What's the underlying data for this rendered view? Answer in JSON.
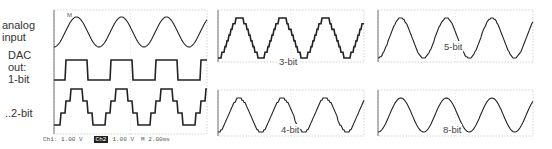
{
  "labels": {
    "analog": "analog\ninput",
    "analog_l1": "analog",
    "analog_l2": "input",
    "dac_l1": "DAC",
    "dac_l2": "out:",
    "dac_l3": "1-bit",
    "bit2": "..2-bit"
  },
  "panels": [
    {
      "id": "left",
      "x": 54,
      "y": 10,
      "w": 153,
      "h": 124,
      "label": ""
    },
    {
      "id": "3bit",
      "x": 218,
      "y": 10,
      "w": 146,
      "h": 52,
      "label": "3-bit",
      "bits": 3
    },
    {
      "id": "5bit",
      "x": 378,
      "y": 10,
      "w": 155,
      "h": 52,
      "label": "5-bit",
      "bits": 5
    },
    {
      "id": "4bit",
      "x": 218,
      "y": 90,
      "w": 146,
      "h": 46,
      "label": "4-bit",
      "bits": 4
    },
    {
      "id": "8bit",
      "x": 378,
      "y": 90,
      "w": 155,
      "h": 46,
      "label": "8-bit",
      "bits": 8
    }
  ],
  "footer": {
    "ch1": "Ch1:  1.00 V",
    "ch2_chip": "Ch2",
    "ch2": "1.00 V",
    "timebase": "M 2.00ms"
  },
  "trigger_marker": "M",
  "waveform": {
    "cycles": 3.4,
    "phase": -1.5708
  }
}
